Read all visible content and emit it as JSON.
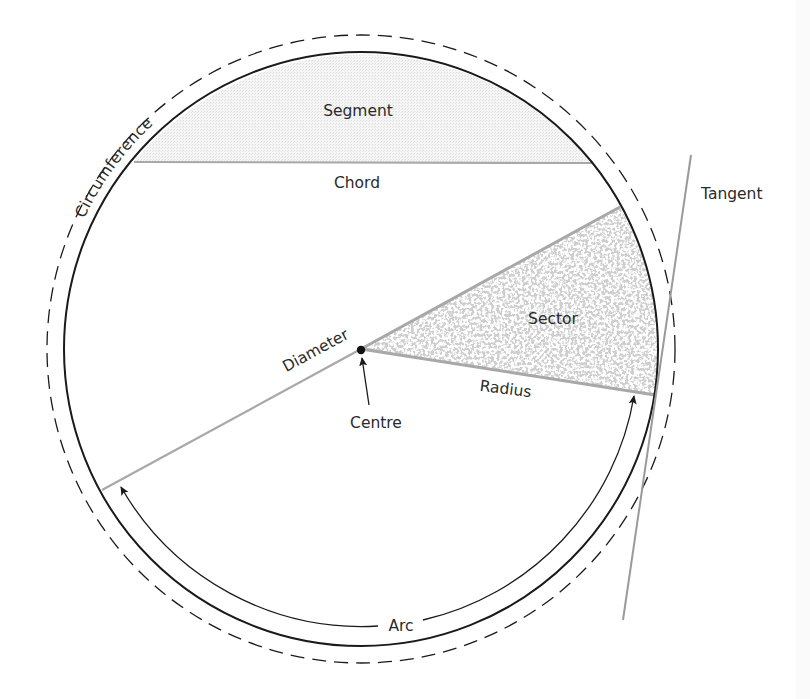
{
  "diagram": {
    "type": "circle-parts",
    "labels": {
      "circumference": "Circumference",
      "segment": "Segment",
      "chord": "Chord",
      "tangent": "Tangent",
      "sector": "Sector",
      "diameter": "Diameter",
      "radius": "Radius",
      "centre": "Centre",
      "arc": "Arc"
    },
    "colors": {
      "outline": "#1a1a1a",
      "grey_line": "#a0a0a0",
      "segment_fill": "#f1f1f1",
      "sector_fill": "#b4b4b4",
      "text": "#2a2a2a"
    },
    "geometry": {
      "centre": [
        361,
        349
      ],
      "circle_radius": 297,
      "dashed_radius": 314,
      "chord": [
        [
          134,
          162
        ],
        [
          592,
          163
        ]
      ],
      "diameter_end": [
        102,
        490
      ],
      "sector_points": [
        [
          620,
          207
        ],
        [
          655,
          395
        ]
      ],
      "tangent": [
        [
          691,
          155
        ],
        [
          623,
          620
        ]
      ]
    }
  }
}
